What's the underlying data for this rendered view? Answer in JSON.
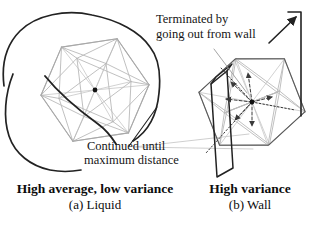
{
  "figure": {
    "annotations": {
      "terminated": {
        "line1": "Terminated by",
        "line2": "going out from wall"
      },
      "continued": {
        "line1": "Continued until",
        "line2": "maximum distance"
      }
    },
    "panels": [
      {
        "caption_bold": "High average, low variance",
        "caption_sub": "(a) Liquid"
      },
      {
        "caption_bold": "High variance",
        "caption_sub": "(b) Wall"
      }
    ],
    "colors": {
      "ink": "#222222",
      "wire": "#b9b9b9",
      "spoke": "#c6c6c6",
      "silhouette_dark": "#5a5a5a",
      "silhouette_light": "#a8a8a8",
      "arrow": "#3a3a3a",
      "leader": "#9a9a9a",
      "connector": "#c3c3c3",
      "dot": "#111111",
      "background": "#ffffff"
    }
  }
}
